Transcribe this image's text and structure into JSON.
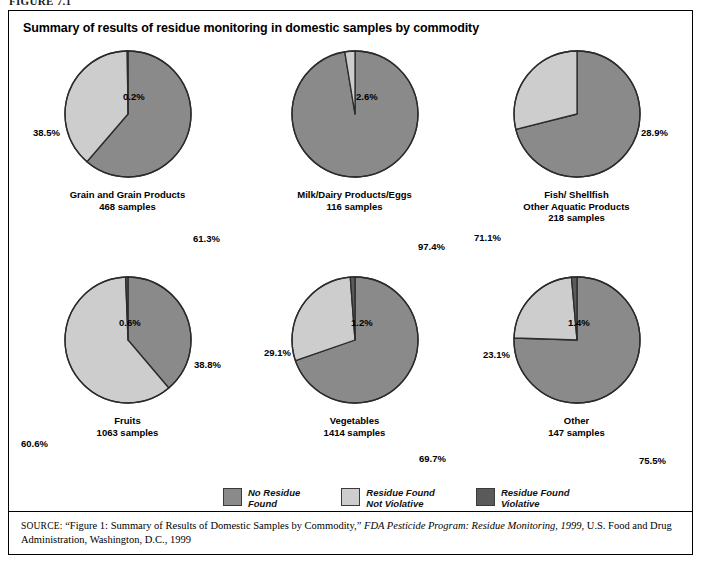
{
  "figure_label": "FIGURE 7.1",
  "chart_title": "Summary of results of residue monitoring in domestic samples by commodity",
  "colors": {
    "no_residue": "#8a8a8a",
    "not_violative": "#cdcdcd",
    "violative": "#5a5a5a",
    "outline": "#2b2b2b",
    "background": "#ffffff",
    "text": "#000000"
  },
  "legend": {
    "items": [
      {
        "name": "legend-no-residue",
        "line1": "No Residue",
        "line2": "Found",
        "color": "#8a8a8a"
      },
      {
        "name": "legend-not-violative",
        "line1": "Residue Found",
        "line2": "Not Violative",
        "color": "#cdcdcd"
      },
      {
        "name": "legend-violative",
        "line1": "Residue Found",
        "line2": "Violative",
        "color": "#5a5a5a"
      }
    ]
  },
  "source": {
    "lead": "SOURCE:",
    "text_before_italic": " “Figure 1: Summary of Results of Domestic Samples by Commodity,” ",
    "italic_title": "FDA Pesticide Program: Residue Monitoring, 1999",
    "text_after_italic": ", U.S. Food and Drug Administration, Washington, D.C., 1999"
  },
  "chart_data": {
    "type": "pie",
    "title": "Summary of results of residue monitoring in domestic samples by commodity",
    "legend_position": "bottom",
    "series_names": [
      "No Residue Found",
      "Residue Found Not Violative",
      "Residue Found Violative"
    ],
    "units": "percent",
    "charts": [
      {
        "id": "grain",
        "caption_lines": [
          "Grain and Grain Products",
          "468 samples"
        ],
        "commodity": "Grain and Grain Products",
        "samples": 468,
        "categories": [
          "No Residue Found",
          "Residue Found Not Violative",
          "Residue Found Violative"
        ],
        "values": [
          61.3,
          38.5,
          0.2
        ],
        "labels": [
          "61.3%",
          "38.5%",
          "0.2%"
        ],
        "label_pos": [
          {
            "text": "0.2%",
            "x": 108,
            "y": 42
          },
          {
            "text": "38.5%",
            "x": 18,
            "y": 78
          },
          {
            "text": "61.3%",
            "x": 178,
            "y": 184
          }
        ]
      },
      {
        "id": "milk",
        "caption_lines": [
          "Milk/Dairy Products/Eggs",
          "116 samples"
        ],
        "commodity": "Milk/Dairy Products/Eggs",
        "samples": 116,
        "categories": [
          "No Residue Found",
          "Residue Found Not Violative",
          "Residue Found Violative"
        ],
        "values": [
          97.4,
          2.6,
          0.0
        ],
        "labels": [
          "97.4%",
          "2.6%",
          ""
        ],
        "label_pos": [
          {
            "text": "2.6%",
            "x": 114,
            "y": 42
          },
          {
            "text": "97.4%",
            "x": 176,
            "y": 192
          }
        ]
      },
      {
        "id": "fish",
        "caption_lines": [
          "Fish/ Shellfish",
          "Other Aquatic Products",
          "218 samples"
        ],
        "commodity": "Fish/ Shellfish Other Aquatic Products",
        "samples": 218,
        "categories": [
          "No Residue Found",
          "Residue Found Not Violative",
          "Residue Found Violative"
        ],
        "values": [
          71.1,
          28.9,
          0.0
        ],
        "labels": [
          "71.1%",
          "28.9%",
          ""
        ],
        "label_pos": [
          {
            "text": "28.9%",
            "x": 177,
            "y": 78
          },
          {
            "text": "71.1%",
            "x": 10,
            "y": 183
          }
        ]
      },
      {
        "id": "fruits",
        "caption_lines": [
          "Fruits",
          "1063 samples"
        ],
        "commodity": "Fruits",
        "samples": 1063,
        "categories": [
          "No Residue Found",
          "Residue Found Not Violative",
          "Residue Found Violative"
        ],
        "values": [
          38.8,
          60.6,
          0.6
        ],
        "labels": [
          "38.8%",
          "60.6%",
          "0.6%"
        ],
        "label_pos": [
          {
            "text": "0.6%",
            "x": 104,
            "y": 42
          },
          {
            "text": "38.8%",
            "x": 179,
            "y": 84
          },
          {
            "text": "60.6%",
            "x": 6,
            "y": 163
          }
        ]
      },
      {
        "id": "vegetables",
        "caption_lines": [
          "Vegetables",
          "1414 samples"
        ],
        "commodity": "Vegetables",
        "samples": 1414,
        "categories": [
          "No Residue Found",
          "Residue Found Not Violative",
          "Residue Found Violative"
        ],
        "values": [
          69.7,
          29.1,
          1.2
        ],
        "labels": [
          "69.7%",
          "29.1%",
          "1.2%"
        ],
        "label_pos": [
          {
            "text": "1.2%",
            "x": 109,
            "y": 42
          },
          {
            "text": "29.1%",
            "x": 22,
            "y": 72
          },
          {
            "text": "69.7%",
            "x": 177,
            "y": 178
          }
        ]
      },
      {
        "id": "other",
        "caption_lines": [
          "Other",
          "147 samples"
        ],
        "commodity": "Other",
        "samples": 147,
        "categories": [
          "No Residue Found",
          "Residue Found Not Violative",
          "Residue Found Violative"
        ],
        "values": [
          75.5,
          23.1,
          1.4
        ],
        "labels": [
          "75.5%",
          "23.1%",
          "1.4%"
        ],
        "label_pos": [
          {
            "text": "1.4%",
            "x": 104,
            "y": 42
          },
          {
            "text": "23.1%",
            "x": 19,
            "y": 74
          },
          {
            "text": "75.5%",
            "x": 175,
            "y": 180
          }
        ]
      }
    ]
  }
}
